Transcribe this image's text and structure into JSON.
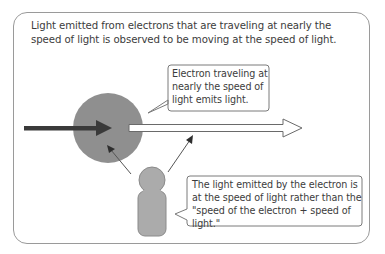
{
  "caption": "Light emitted from electrons that are traveling at nearly the speed of light is observed to be moving at the speed of light.",
  "bubbles": {
    "electron": {
      "line1": "Electron traveling at",
      "line2": "nearly the speed of",
      "line3": "light emits light."
    },
    "observer": {
      "line1": "The light emitted by the electron is",
      "line2": "at the speed of light rather than the",
      "line3": "\"speed of the electron + speed of light.\""
    }
  },
  "elements": {
    "electron": "gray circle",
    "electron_motion_arrow": "dark arrow",
    "light_arrow": "white outlined arrow",
    "observer": "gray person figure"
  },
  "colors": {
    "frame": "#9a9a9a",
    "electron_fill": "#8f8f8f",
    "dark_arrow": "#3a3a3a",
    "person_fill": "#ababab",
    "bubble_border": "#7a7a7a",
    "text": "#3c3c3c"
  }
}
